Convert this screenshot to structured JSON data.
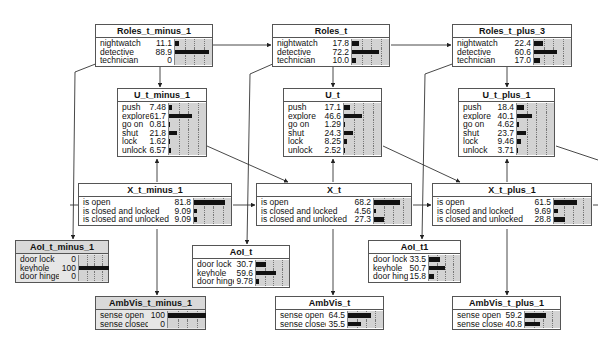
{
  "diagram": {
    "type": "bayesian-network",
    "colors": {
      "bar": "#111111",
      "barcell_bg": "#d3d3d3",
      "gray_node": "#e6e6e6",
      "border": "#555555",
      "edge": "#333333"
    },
    "nodes": [
      {
        "id": "roles_t_minus_1",
        "title": "Roles_t_minus_1",
        "x": 95,
        "y": 24,
        "w": 118,
        "valw": 24,
        "barw": 38,
        "gray": false,
        "rows": [
          {
            "label": "nightwatch",
            "value": "11.1",
            "pct": 11.1
          },
          {
            "label": "detective",
            "value": "88.9",
            "pct": 88.9
          },
          {
            "label": "technician",
            "value": "0",
            "pct": 0
          }
        ]
      },
      {
        "id": "roles_t",
        "title": "Roles_t",
        "x": 272,
        "y": 24,
        "w": 118,
        "valw": 24,
        "barw": 38,
        "gray": false,
        "rows": [
          {
            "label": "nightwatch",
            "value": "17.8",
            "pct": 17.8
          },
          {
            "label": "detective",
            "value": "72.2",
            "pct": 72.2
          },
          {
            "label": "technician",
            "value": "10.0",
            "pct": 10.0
          }
        ]
      },
      {
        "id": "roles_t_plus_3",
        "title": "Roles_t_plus_3",
        "x": 452,
        "y": 24,
        "w": 120,
        "valw": 24,
        "barw": 38,
        "gray": false,
        "rows": [
          {
            "label": "nightwatch",
            "value": "22.4",
            "pct": 22.4
          },
          {
            "label": "detective",
            "value": "60.6",
            "pct": 60.6
          },
          {
            "label": "technician",
            "value": "17.0",
            "pct": 17.0
          }
        ]
      },
      {
        "id": "u_t_minus_1",
        "title": "U_t_minus_1",
        "x": 117,
        "y": 88,
        "w": 90,
        "valw": 18,
        "barw": 38,
        "gray": false,
        "rows": [
          {
            "label": "push",
            "value": "7.48",
            "pct": 7.48
          },
          {
            "label": "explore",
            "value": "61.7",
            "pct": 61.7
          },
          {
            "label": "go on",
            "value": "0.81",
            "pct": 0.81
          },
          {
            "label": "shut",
            "value": "21.8",
            "pct": 21.8
          },
          {
            "label": "lock",
            "value": "1.62",
            "pct": 1.62
          },
          {
            "label": "unlock",
            "value": "6.57",
            "pct": 6.57
          }
        ]
      },
      {
        "id": "u_t",
        "title": "U_t",
        "x": 283,
        "y": 88,
        "w": 99,
        "valw": 20,
        "barw": 38,
        "gray": false,
        "rows": [
          {
            "label": "push",
            "value": "17.1",
            "pct": 17.1
          },
          {
            "label": "explore",
            "value": "46.6",
            "pct": 46.6
          },
          {
            "label": "go on",
            "value": "1.29",
            "pct": 1.29
          },
          {
            "label": "shut",
            "value": "24.3",
            "pct": 24.3
          },
          {
            "label": "lock",
            "value": "8.25",
            "pct": 8.25
          },
          {
            "label": "unlock",
            "value": "2.52",
            "pct": 2.52
          }
        ]
      },
      {
        "id": "u_t_plus_1",
        "title": "U_t_plus_1",
        "x": 458,
        "y": 88,
        "w": 97,
        "valw": 20,
        "barw": 38,
        "gray": false,
        "rows": [
          {
            "label": "push",
            "value": "18.4",
            "pct": 18.4
          },
          {
            "label": "explore",
            "value": "40.1",
            "pct": 40.1
          },
          {
            "label": "go on",
            "value": "4.62",
            "pct": 4.62
          },
          {
            "label": "shut",
            "value": "23.7",
            "pct": 23.7
          },
          {
            "label": "lock",
            "value": "9.46",
            "pct": 9.46
          },
          {
            "label": "unlock",
            "value": "3.71",
            "pct": 3.71
          }
        ]
      },
      {
        "id": "x_t_minus_1",
        "title": "X_t_minus_1",
        "x": 78,
        "y": 183,
        "w": 154,
        "valw": 20,
        "barw": 38,
        "gray": false,
        "rows": [
          {
            "label": "is open",
            "value": "81.8",
            "pct": 81.8
          },
          {
            "label": "is closed and locked",
            "value": "9.09",
            "pct": 9.09
          },
          {
            "label": "is closed and unlocked",
            "value": "9.09",
            "pct": 9.09
          }
        ]
      },
      {
        "id": "x_t",
        "title": "X_t",
        "x": 256,
        "y": 183,
        "w": 156,
        "valw": 20,
        "barw": 38,
        "gray": false,
        "rows": [
          {
            "label": "is open",
            "value": "68.2",
            "pct": 68.2
          },
          {
            "label": "is closed and locked",
            "value": "4.56",
            "pct": 4.56
          },
          {
            "label": "is closed and unlocked",
            "value": "27.3",
            "pct": 27.3
          }
        ]
      },
      {
        "id": "x_t_plus_1",
        "title": "X_t_plus_1",
        "x": 432,
        "y": 183,
        "w": 160,
        "valw": 20,
        "barw": 38,
        "gray": false,
        "rows": [
          {
            "label": "is open",
            "value": "61.5",
            "pct": 61.5
          },
          {
            "label": "is closed and locked",
            "value": "9.69",
            "pct": 9.69
          },
          {
            "label": "is closed and unlocked",
            "value": "28.8",
            "pct": 28.8
          }
        ]
      },
      {
        "id": "aoi_t_minus_1",
        "title": "AoI_t_minus_1",
        "x": 15,
        "y": 240,
        "w": 94,
        "valw": 18,
        "barw": 30,
        "gray": true,
        "rows": [
          {
            "label": "door lock",
            "value": "0",
            "pct": 0
          },
          {
            "label": "keyhole",
            "value": "100",
            "pct": 100
          },
          {
            "label": "door hinge",
            "value": "0",
            "pct": 0
          }
        ]
      },
      {
        "id": "aoi_t",
        "title": "AoI_t",
        "x": 192,
        "y": 245,
        "w": 98,
        "valw": 20,
        "barw": 34,
        "gray": false,
        "rows": [
          {
            "label": "door lock",
            "value": "30.7",
            "pct": 30.7
          },
          {
            "label": "keyhole",
            "value": "59.6",
            "pct": 59.6
          },
          {
            "label": "door hinge",
            "value": "9.78",
            "pct": 9.78
          }
        ]
      },
      {
        "id": "aoi_t1",
        "title": "AoI_t1",
        "x": 368,
        "y": 240,
        "w": 93,
        "valw": 20,
        "barw": 32,
        "gray": false,
        "rows": [
          {
            "label": "door lock",
            "value": "33.5",
            "pct": 33.5
          },
          {
            "label": "keyhole",
            "value": "50.7",
            "pct": 50.7
          },
          {
            "label": "door hinge",
            "value": "15.8",
            "pct": 15.8
          }
        ]
      },
      {
        "id": "ambvis_t_minus_1",
        "title": "AmbVis_t_minus_1",
        "x": 95,
        "y": 296,
        "w": 111,
        "valw": 18,
        "barw": 38,
        "gray": true,
        "rows": [
          {
            "label": "sense open",
            "value": "100",
            "pct": 100
          },
          {
            "label": "sense closed",
            "value": "0",
            "pct": 0
          }
        ]
      },
      {
        "id": "ambvis_t",
        "title": "AmbVis_t",
        "x": 275,
        "y": 296,
        "w": 109,
        "valw": 20,
        "barw": 36,
        "gray": false,
        "rows": [
          {
            "label": "sense open",
            "value": "64.5",
            "pct": 64.5
          },
          {
            "label": "sense closed",
            "value": "35.5",
            "pct": 35.5
          }
        ]
      },
      {
        "id": "ambvis_t_plus_1",
        "title": "AmbVis_t_plus_1",
        "x": 452,
        "y": 296,
        "w": 109,
        "valw": 20,
        "barw": 36,
        "gray": false,
        "rows": [
          {
            "label": "sense open",
            "value": "59.2",
            "pct": 59.2
          },
          {
            "label": "sense closed",
            "value": "40.8",
            "pct": 40.8
          }
        ]
      }
    ],
    "edges": [
      {
        "from": "roles_t_minus_1",
        "to": "roles_t",
        "points": [
          [
            213,
            45
          ],
          [
            271,
            45
          ]
        ]
      },
      {
        "from": "roles_t",
        "to": "roles_t_plus_3",
        "points": [
          [
            391,
            45
          ],
          [
            451,
            45
          ]
        ]
      },
      {
        "from": "roles_t_minus_1",
        "to": "u_t_minus_1",
        "points": [
          [
            160,
            64
          ],
          [
            160,
            87
          ]
        ]
      },
      {
        "from": "roles_t",
        "to": "u_t",
        "points": [
          [
            333,
            64
          ],
          [
            333,
            87
          ]
        ]
      },
      {
        "from": "roles_t_plus_3",
        "to": "u_t_plus_1",
        "points": [
          [
            507,
            64
          ],
          [
            507,
            87
          ]
        ]
      },
      {
        "from": "roles_t_minus_1",
        "to": "aoi_t_minus_1",
        "points": [
          [
            98,
            63
          ],
          [
            75,
            72
          ],
          [
            73,
            239
          ]
        ]
      },
      {
        "from": "roles_t",
        "to": "aoi_t",
        "points": [
          [
            275,
            63
          ],
          [
            250,
            74
          ],
          [
            247,
            244
          ]
        ]
      },
      {
        "from": "roles_t_plus_3",
        "to": "aoi_t1",
        "points": [
          [
            455,
            63
          ],
          [
            425,
            74
          ],
          [
            422,
            239
          ]
        ]
      },
      {
        "from": "x_t_minus_1",
        "to": "u_t_minus_1",
        "points": [
          [
            157,
            182
          ],
          [
            157,
            159
          ]
        ]
      },
      {
        "from": "x_t",
        "to": "u_t",
        "points": [
          [
            333,
            182
          ],
          [
            333,
            159
          ]
        ]
      },
      {
        "from": "x_t_plus_1",
        "to": "u_t_plus_1",
        "points": [
          [
            507,
            182
          ],
          [
            507,
            159
          ]
        ]
      },
      {
        "from": "u_t_minus_1",
        "to": "x_t",
        "points": [
          [
            207,
            146
          ],
          [
            288,
            182
          ]
        ]
      },
      {
        "from": "u_t",
        "to": "x_t_plus_1",
        "points": [
          [
            383,
            146
          ],
          [
            460,
            182
          ]
        ]
      },
      {
        "from": "x_t_minus_1",
        "to": "x_t",
        "points": [
          [
            233,
            205
          ],
          [
            255,
            205
          ]
        ]
      },
      {
        "from": "x_t",
        "to": "x_t_plus_1",
        "points": [
          [
            413,
            205
          ],
          [
            431,
            205
          ]
        ]
      },
      {
        "from": "x_t_minus_1",
        "to": "ambvis_t_minus_1",
        "points": [
          [
            157,
            229
          ],
          [
            157,
            295
          ]
        ]
      },
      {
        "from": "x_t",
        "to": "ambvis_t",
        "points": [
          [
            333,
            229
          ],
          [
            333,
            295
          ]
        ]
      },
      {
        "from": "x_t_plus_1",
        "to": "ambvis_t_plus_1",
        "points": [
          [
            507,
            229
          ],
          [
            507,
            295
          ]
        ]
      },
      {
        "from": "x_t_plus_1",
        "to": "right-edge",
        "points": [
          [
            593,
            205
          ],
          [
            598,
            205
          ]
        ]
      },
      {
        "from": "u_t_plus_1",
        "to": "right-edge",
        "points": [
          [
            556,
            146
          ],
          [
            598,
            160
          ]
        ]
      },
      {
        "from": "x_t_minus_1",
        "to": "left-edge",
        "points": [
          [
            78,
            205
          ],
          [
            70,
            205
          ]
        ]
      }
    ]
  }
}
